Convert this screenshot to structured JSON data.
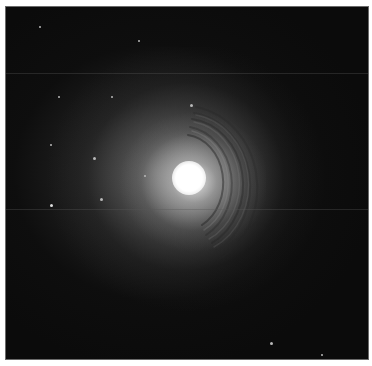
{
  "image": {
    "subject": "shell elliptical galaxy",
    "background_color": "#0b0b0b",
    "core_color": "#ffffff",
    "core_center": [
      187,
      177
    ],
    "stars": [
      [
        38,
        25
      ],
      [
        137,
        39
      ],
      [
        57,
        95
      ],
      [
        110,
        95
      ],
      [
        190,
        103
      ],
      [
        49,
        143
      ],
      [
        92,
        156
      ],
      [
        143,
        174
      ],
      [
        99,
        197
      ],
      [
        50,
        204
      ],
      [
        269,
        341
      ],
      [
        320,
        354
      ]
    ]
  }
}
